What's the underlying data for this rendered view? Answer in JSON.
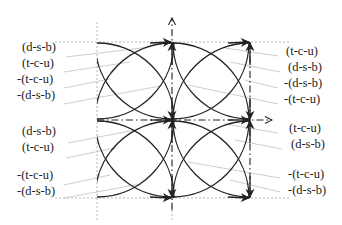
{
  "diagram": {
    "square": {
      "x0": 97,
      "y0": 42,
      "x1": 250,
      "y1": 198,
      "cx": 172,
      "cy": 120
    },
    "colors": {
      "curve": "#222222",
      "guide": "#9a9a9a",
      "leader": "#b4b4b4",
      "text": "#222222"
    },
    "left_labels": [
      {
        "text": "(d-s-b)",
        "x": 22,
        "y": 47
      },
      {
        "text": "(t-c-u)",
        "x": 22,
        "y": 63
      },
      {
        "text": "-(t-c-u)",
        "x": 17,
        "y": 79
      },
      {
        "text": "-(d-s-b)",
        "x": 17,
        "y": 95
      },
      {
        "text": "(d-s-b)",
        "x": 22,
        "y": 131
      },
      {
        "text": "(t-c-u)",
        "x": 22,
        "y": 147
      },
      {
        "text": "-(t-c-u)",
        "x": 17,
        "y": 175
      },
      {
        "text": "-(d-s-b)",
        "x": 17,
        "y": 191
      }
    ],
    "right_labels": [
      {
        "text": "(t-c-u)",
        "x": 286,
        "y": 51
      },
      {
        "text": "(d-s-b)",
        "x": 288,
        "y": 67
      },
      {
        "text": "-(d-s-b)",
        "x": 284,
        "y": 83
      },
      {
        "text": "-(t-c-u)",
        "x": 284,
        "y": 99
      },
      {
        "text": "(t-c-u)",
        "x": 289,
        "y": 128
      },
      {
        "text": "(d-s-b)",
        "x": 291,
        "y": 144
      },
      {
        "text": "-(t-c-u)",
        "x": 288,
        "y": 174
      },
      {
        "text": "-(d-s-b)",
        "x": 288,
        "y": 190
      }
    ]
  }
}
